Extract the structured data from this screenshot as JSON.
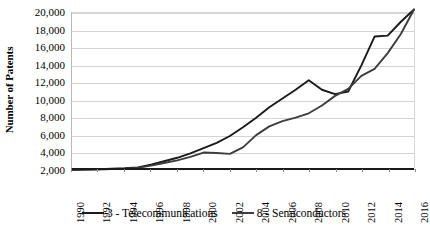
{
  "chart_data": {
    "type": "line",
    "title": "",
    "xlabel": "",
    "ylabel": "Number of Patents",
    "grid": true,
    "legend_position": "bottom",
    "xlim": [
      1990,
      2016
    ],
    "ylim": [
      2000,
      20000
    ],
    "y_ticks": [
      2000,
      4000,
      6000,
      8000,
      10000,
      12000,
      14000,
      16000,
      18000,
      20000
    ],
    "y_tick_labels": [
      "2,000",
      "4,000",
      "6,000",
      "8,000",
      "10,000",
      "12,000",
      "14,000",
      "16,000",
      "18,000",
      "20,000"
    ],
    "x_ticks": [
      1990,
      1992,
      1994,
      1996,
      1998,
      2000,
      2002,
      2004,
      2006,
      2008,
      2010,
      2012,
      2014,
      2016
    ],
    "x_tick_labels": [
      "1990",
      "1992",
      "1994",
      "1996",
      "1998",
      "2000",
      "2002",
      "2004",
      "2006",
      "2008",
      "2010",
      "2012",
      "2014",
      "2016"
    ],
    "x": [
      1990,
      1991,
      1992,
      1993,
      1994,
      1995,
      1996,
      1997,
      1998,
      1999,
      2000,
      2001,
      2002,
      2003,
      2004,
      2005,
      2006,
      2007,
      2008,
      2009,
      2010,
      2011,
      2012,
      2013,
      2014,
      2015,
      2016
    ],
    "series": [
      {
        "name": "3 - Telecommunications",
        "color": "#1a1a1a",
        "values": [
          2050,
          2080,
          2100,
          2150,
          2200,
          2300,
          2600,
          3000,
          3400,
          3900,
          4500,
          5100,
          5900,
          6900,
          8000,
          9200,
          10200,
          11200,
          12300,
          11200,
          10700,
          11000,
          14000,
          17300,
          17400,
          19000,
          20400
        ]
      },
      {
        "name": "8 - Semiconductors",
        "color": "#3d3d3d",
        "values": [
          2000,
          2020,
          2050,
          2100,
          2150,
          2250,
          2500,
          2800,
          3100,
          3500,
          4000,
          3950,
          3850,
          4600,
          6000,
          7000,
          7600,
          8000,
          8500,
          9400,
          10500,
          11300,
          12800,
          13600,
          15400,
          17600,
          20400
        ]
      }
    ]
  },
  "legend": {
    "entries": [
      {
        "label": "3 - Telecommunications",
        "color": "#1a1a1a"
      },
      {
        "label": "8 - Semiconductors",
        "color": "#3d3d3d"
      }
    ]
  }
}
